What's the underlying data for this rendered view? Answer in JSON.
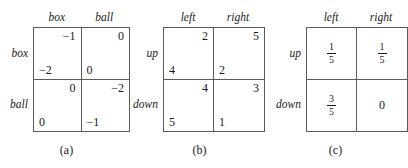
{
  "figure": {
    "panels": [
      {
        "id": "a",
        "caption": "(a)",
        "type": "bimatrix",
        "col_headers": [
          "box",
          "ball"
        ],
        "row_labels": [
          "box",
          "ball"
        ],
        "cells": [
          [
            {
              "top_right": "−1",
              "bottom_left": "−2"
            },
            {
              "top_right": "0",
              "bottom_left": "0"
            }
          ],
          [
            {
              "top_right": "0",
              "bottom_left": "0"
            },
            {
              "top_right": "−2",
              "bottom_left": "−1"
            }
          ]
        ]
      },
      {
        "id": "b",
        "caption": "(b)",
        "type": "bimatrix",
        "col_headers": [
          "left",
          "right"
        ],
        "row_labels": [
          "up",
          "down"
        ],
        "cells": [
          [
            {
              "top_right": "2",
              "bottom_left": "4"
            },
            {
              "top_right": "5",
              "bottom_left": "2"
            }
          ],
          [
            {
              "top_right": "4",
              "bottom_left": "5"
            },
            {
              "top_right": "3",
              "bottom_left": "1"
            }
          ]
        ]
      },
      {
        "id": "c",
        "caption": "(c)",
        "type": "probability",
        "col_headers": [
          "left",
          "right"
        ],
        "row_labels": [
          "up",
          "down"
        ],
        "cells": [
          [
            {
              "numerator": "1",
              "denominator": "5"
            },
            {
              "numerator": "1",
              "denominator": "5"
            }
          ],
          [
            {
              "numerator": "3",
              "denominator": "5"
            },
            {
              "whole": "0"
            }
          ]
        ]
      }
    ]
  }
}
